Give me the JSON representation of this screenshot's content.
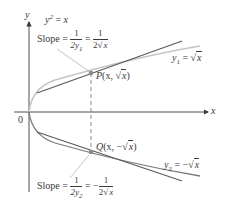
{
  "diagram": {
    "curve_equation": {
      "lhs": "y",
      "exp": "2",
      "eq": " = ",
      "rhs": "x"
    },
    "axis_labels": {
      "x": "x",
      "y": "y",
      "origin": "0"
    },
    "point_P": {
      "name": "P",
      "coords_open": "(x, ",
      "coords_root": "x",
      "coords_close": ")"
    },
    "point_Q": {
      "name": "Q",
      "coords_open": "(x, −",
      "coords_root": "x",
      "coords_close": ")"
    },
    "upper_branch": {
      "var": "y",
      "sub": "1",
      "eq": " = ",
      "root": "x"
    },
    "lower_branch": {
      "var": "y",
      "sub": "2",
      "eq": " = −",
      "root": "x"
    },
    "upper_slope": {
      "word": "Slope = ",
      "num1": "1",
      "den1_pre": "2y",
      "den1_sub": "1",
      "eq": " = ",
      "num2": "1",
      "den2_pre": "2",
      "den2_root": "x"
    },
    "lower_slope": {
      "word": "Slope = ",
      "num1": "1",
      "den1_pre": "2y",
      "den1_sub": "2",
      "eq": " = −",
      "num2": "1",
      "den2_pre": "2",
      "den2_root": "x"
    },
    "colors": {
      "axes": "#3a3a3a",
      "tangent": "#5a5a5a",
      "upper_curve": "#c4c4c4",
      "lower_curve": "#7a7a7a",
      "point": "#8a8a8a"
    }
  }
}
